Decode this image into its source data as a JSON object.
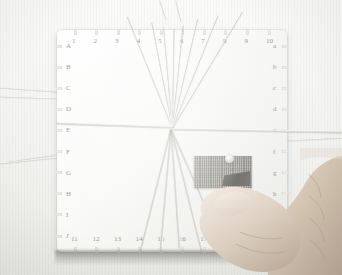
{
  "scene": {
    "subject": "braiding board",
    "caption": "",
    "orientation": "square board viewed from above"
  },
  "board": {
    "top_labels": [
      "1",
      "2",
      "3",
      "4",
      "5",
      "6",
      "7",
      "8",
      "9",
      "10"
    ],
    "bottom_labels": [
      "11",
      "12",
      "13",
      "14",
      "15",
      "16",
      "17",
      "18",
      "19",
      "20"
    ],
    "left_labels": [
      "A",
      "B",
      "C",
      "D",
      "E",
      "F",
      "G",
      "H",
      "I",
      "J"
    ],
    "right_labels": [
      "a",
      "b",
      "c",
      "d",
      "e",
      "f",
      "g",
      "h",
      "i",
      "j"
    ],
    "colors": {
      "board_face": "#fafaf8",
      "notch": "#ecebe7",
      "label_text": "#9a9892",
      "patch_light": "#b9b8b4",
      "patch_dark": "#5f5e59",
      "thread": "#e4e3de",
      "background": "#f4f4f2",
      "skin": "#d8cabb"
    }
  },
  "center": {
    "patch_name": "woven braid patch",
    "knot_name": "thread convergence knot"
  },
  "threads": {
    "top_fan": [
      {
        "angle": -112,
        "length": 120
      },
      {
        "angle": -101,
        "length": 108
      },
      {
        "angle": -95,
        "length": 102
      },
      {
        "angle": -89,
        "length": 100
      },
      {
        "angle": -84,
        "length": 104
      },
      {
        "angle": -77,
        "length": 112
      },
      {
        "angle": -68,
        "length": 122
      },
      {
        "angle": -59,
        "length": 136
      }
    ],
    "bottom_fan": [
      {
        "angle": 104,
        "length": 126
      },
      {
        "angle": 95,
        "length": 122
      },
      {
        "angle": 86,
        "length": 120
      },
      {
        "angle": 76,
        "length": 126
      },
      {
        "angle": 66,
        "length": 136
      }
    ],
    "horizontal": [
      {
        "angle": 182,
        "length": 116
      },
      {
        "angle": 1,
        "length": 170
      }
    ],
    "loose_left": [
      {
        "angle": 186,
        "length": 60
      },
      {
        "angle": 170,
        "length": 52
      }
    ]
  },
  "hand": {
    "name": "human hand holding board",
    "visible_parts": [
      "thumb",
      "index finger",
      "knuckles"
    ]
  }
}
